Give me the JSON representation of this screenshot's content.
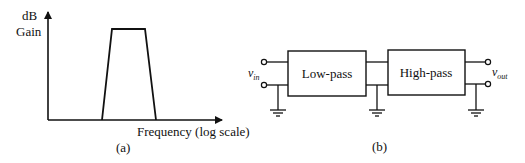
{
  "panel_a": {
    "y_axis_label_line1": "dB",
    "y_axis_label_line2": "Gain",
    "x_axis_label": "Frequency (log scale)",
    "caption": "(a)",
    "shape": "band-pass trapezoid"
  },
  "panel_b": {
    "input_label_main": "v",
    "input_label_sub": "in",
    "output_label_main": "v",
    "output_label_sub": "out",
    "block1_label": "Low-pass",
    "block2_label": "High-pass",
    "caption": "(b)"
  },
  "colors": {
    "stroke": "#111111",
    "background": "#ffffff"
  }
}
